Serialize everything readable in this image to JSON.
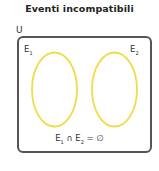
{
  "title": "Eventi incompatibili",
  "universe_label": "U",
  "sets": [
    {
      "label": "E",
      "subscript": "1"
    },
    {
      "label": "E",
      "subscript": "2"
    }
  ],
  "formula": {
    "a": "E",
    "a_sub": "1",
    "op": " ∩ ",
    "b": "E",
    "b_sub": "2",
    "rest": " = ∅"
  },
  "colors": {
    "ellipse_stroke": "#f0dc4a",
    "border": "#555555"
  }
}
